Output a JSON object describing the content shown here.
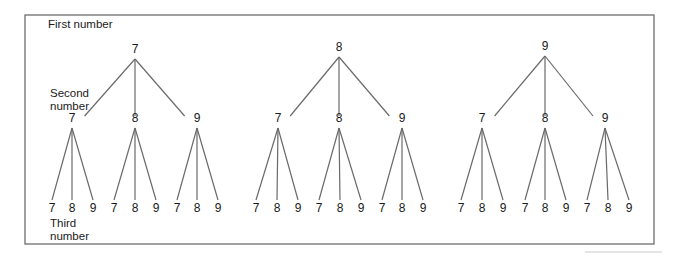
{
  "figure": {
    "frame": {
      "left": 25,
      "top": 15,
      "right": 654,
      "bottom": 244,
      "color": "#6e6e6e"
    },
    "line_color": "#6a6a6a",
    "labels": {
      "first": "First number",
      "second_line1": "Second",
      "second_line2": "number",
      "third_line1": "Third",
      "third_line2": "number"
    },
    "trees": [
      {
        "root": {
          "label": "7",
          "x": 135,
          "y": 53
        },
        "children": [
          {
            "label": "7",
            "x": 72,
            "leaves": [
              {
                "label": "7",
                "x": 52
              },
              {
                "label": "8",
                "x": 72
              },
              {
                "label": "9",
                "x": 93
              }
            ]
          },
          {
            "label": "8",
            "x": 135,
            "leaves": [
              {
                "label": "7",
                "x": 114
              },
              {
                "label": "8",
                "x": 135
              },
              {
                "label": "9",
                "x": 156
              }
            ]
          },
          {
            "label": "9",
            "x": 197,
            "leaves": [
              {
                "label": "7",
                "x": 177
              },
              {
                "label": "8",
                "x": 197
              },
              {
                "label": "9",
                "x": 218
              }
            ]
          }
        ]
      },
      {
        "root": {
          "label": "8",
          "x": 339,
          "y": 51
        },
        "children": [
          {
            "label": "7",
            "x": 278,
            "leaves": [
              {
                "label": "7",
                "x": 256
              },
              {
                "label": "8",
                "x": 277
              },
              {
                "label": "9",
                "x": 298
              }
            ]
          },
          {
            "label": "8",
            "x": 339,
            "leaves": [
              {
                "label": "7",
                "x": 319
              },
              {
                "label": "8",
                "x": 340
              },
              {
                "label": "9",
                "x": 361
              }
            ]
          },
          {
            "label": "9",
            "x": 402,
            "leaves": [
              {
                "label": "7",
                "x": 382
              },
              {
                "label": "8",
                "x": 402
              },
              {
                "label": "9",
                "x": 423
              }
            ]
          }
        ]
      },
      {
        "root": {
          "label": "9",
          "x": 545,
          "y": 50
        },
        "children": [
          {
            "label": "7",
            "x": 482,
            "leaves": [
              {
                "label": "7",
                "x": 461
              },
              {
                "label": "8",
                "x": 482
              },
              {
                "label": "9",
                "x": 503
              }
            ]
          },
          {
            "label": "8",
            "x": 545,
            "leaves": [
              {
                "label": "7",
                "x": 525
              },
              {
                "label": "8",
                "x": 545
              },
              {
                "label": "9",
                "x": 566
              }
            ]
          },
          {
            "label": "9",
            "x": 605,
            "leaves": [
              {
                "label": "7",
                "x": 587
              },
              {
                "label": "8",
                "x": 608
              },
              {
                "label": "9",
                "x": 629
              }
            ]
          }
        ]
      }
    ]
  }
}
